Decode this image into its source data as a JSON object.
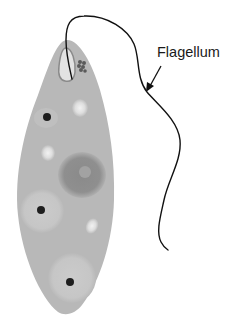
{
  "diagram": {
    "labels": [
      {
        "id": "flagellum",
        "text": "Flagellum",
        "x": 157,
        "y": 44
      }
    ],
    "colors": {
      "background": "#ffffff",
      "cytoplasm": "#b8b8b8",
      "nucleus": "#8e8e8e",
      "nucleolus": "#a4a4a4",
      "light_vacuole": "#e6e6e6",
      "pale_region": "#c8c8c8",
      "dark_dot": "#222222",
      "flagellum": "#111111",
      "reservoir": "#d4d4d4",
      "eyespot": "#6a6a6a"
    }
  }
}
